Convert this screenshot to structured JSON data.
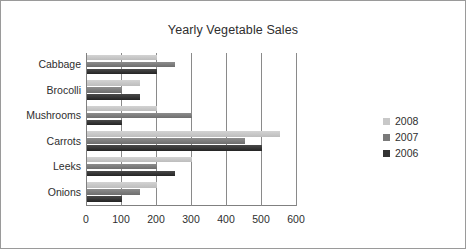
{
  "chart_data": {
    "type": "bar",
    "orientation": "horizontal",
    "title": "Yearly Vegetable Sales",
    "xlabel": "",
    "ylabel": "",
    "xlim": [
      0,
      600
    ],
    "xticks": [
      0,
      100,
      200,
      300,
      400,
      500,
      600
    ],
    "xtick_labels": [
      "0",
      "100",
      "200",
      "300",
      "400",
      "500",
      "600"
    ],
    "grid": "vertical",
    "legend_position": "right",
    "categories": [
      "Cabbage",
      "Brocolli",
      "Mushrooms",
      "Carrots",
      "Leeks",
      "Onions"
    ],
    "series": [
      {
        "name": "2008",
        "color": "#c8c8c8",
        "values": [
          200,
          150,
          200,
          550,
          300,
          200
        ]
      },
      {
        "name": "2007",
        "color": "#7a7a7a",
        "values": [
          250,
          100,
          300,
          450,
          200,
          150
        ]
      },
      {
        "name": "2006",
        "color": "#333333",
        "values": [
          200,
          150,
          100,
          500,
          250,
          100
        ]
      }
    ]
  }
}
